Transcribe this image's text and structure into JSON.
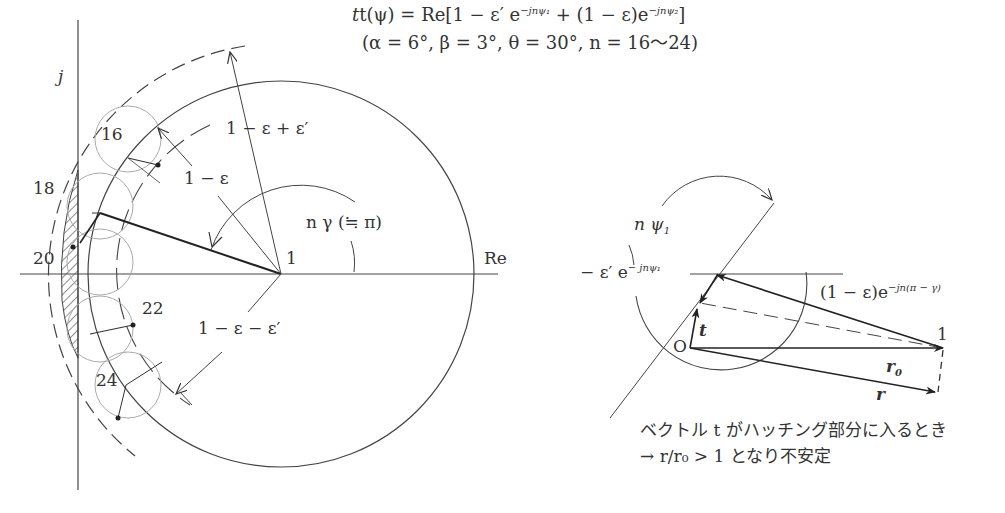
{
  "title": {
    "formula_prefix": "t(ψ) = Re[1 − ε′ e",
    "exp1": "−jnψ₁",
    "formula_mid": " + (1 − ε)e",
    "exp2": "−jnψ₂",
    "formula_suffix": "]",
    "params": "(α = 6°, β = 3°, θ = 30°, n = 16〜24)"
  },
  "left_diagram": {
    "axis_imag": "j",
    "axis_real": "Re",
    "center_point": "1",
    "radius_outer_label": "1 − ε + ε′",
    "radius_mid_label": "1 − ε",
    "radius_inner_label": "1 − ε − ε′",
    "angle_label": "n γ (≒ π)",
    "n_labels": [
      "16",
      "18",
      "20",
      "22",
      "24"
    ],
    "colors": {
      "line": "#333333",
      "faint": "#999999",
      "hatch": "#444444"
    }
  },
  "right_diagram": {
    "angle_label": "n ψ",
    "angle_sub": "1",
    "eps_vector_prefix": "− ε′ e",
    "eps_vector_exp": "− jnψ₁",
    "main_vector_prefix": "(1 − ε)e",
    "main_vector_exp": "−jn(π − γ)",
    "origin_label": "O",
    "point_label": "1",
    "t_label": "t",
    "r0_label": "r",
    "r0_sub": "0",
    "r_label": "r"
  },
  "notes": {
    "line1": "ベクトル t がハッチング部分に入るとき",
    "line2": "→ r/r₀ > 1 となり不安定"
  }
}
